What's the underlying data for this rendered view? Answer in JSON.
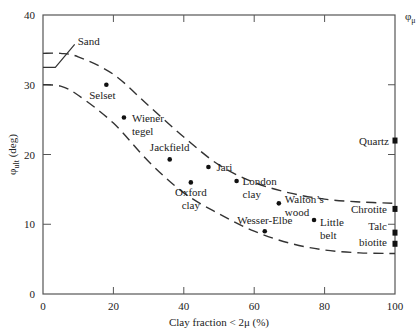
{
  "chart_data": {
    "type": "scatter",
    "title": "",
    "xlabel": "Clay fraction < 2μ (%)",
    "ylabel": "φult (deg)",
    "ylabel_main": "φ",
    "ylabel_sub": "ult",
    "ylabel_unit": " (deg)",
    "right_axis_label_main": "φ",
    "right_axis_label_sub": "μ",
    "xlim": [
      0,
      100
    ],
    "ylim": [
      0,
      40
    ],
    "x_ticks": [
      0,
      20,
      40,
      60,
      80,
      100
    ],
    "y_ticks": [
      0,
      10,
      20,
      30,
      40
    ],
    "grid": false,
    "series": [
      {
        "name": "Soils",
        "marker": "circle",
        "points": [
          {
            "label": "Selset",
            "x": 18,
            "y": 30
          },
          {
            "label": "Wiener tegel",
            "x": 23,
            "y": 25.3
          },
          {
            "label": "Jackfield",
            "x": 36,
            "y": 19.3
          },
          {
            "label": "Jari",
            "x": 47,
            "y": 18.2
          },
          {
            "label": "Oxford clay",
            "x": 42,
            "y": 16
          },
          {
            "label": "London clay",
            "x": 55,
            "y": 16.2
          },
          {
            "label": "Walton's wood",
            "x": 67,
            "y": 13
          },
          {
            "label": "Little belt",
            "x": 77,
            "y": 10.6
          },
          {
            "label": "Wesser-Elbe",
            "x": 63,
            "y": 9
          }
        ]
      },
      {
        "name": "Minerals",
        "marker": "square",
        "points": [
          {
            "label": "Quartz",
            "x": 100,
            "y": 22
          },
          {
            "label": "Chrotite",
            "x": 100,
            "y": 12.2
          },
          {
            "label": "Talc",
            "x": 100,
            "y": 8.8
          },
          {
            "label": "biotite",
            "x": 100,
            "y": 7.2
          }
        ]
      }
    ],
    "envelopes": [
      {
        "name": "upper bound",
        "style": "dashed",
        "x": [
          0,
          5,
          10,
          20,
          30,
          40,
          50,
          60,
          70,
          80,
          90,
          100
        ],
        "y": [
          34.5,
          34.5,
          34,
          31.5,
          27,
          22.5,
          18.5,
          16,
          14.5,
          13.6,
          13.2,
          13
        ]
      },
      {
        "name": "lower bound",
        "style": "dashed",
        "x": [
          0,
          5,
          10,
          20,
          30,
          40,
          50,
          60,
          70,
          80,
          90,
          100
        ],
        "y": [
          30,
          29.8,
          28.5,
          24.5,
          19,
          14.5,
          11.5,
          9,
          7.3,
          6.3,
          5.9,
          5.8
        ]
      }
    ],
    "annotations": [
      {
        "text": "Sand",
        "note": "line from y=32.5 at x=0 to x=3.5, rising to ~36 at x=9"
      }
    ]
  }
}
